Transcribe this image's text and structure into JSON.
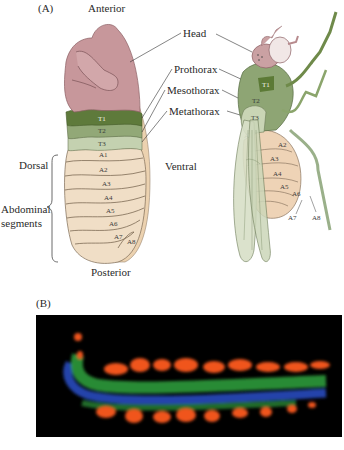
{
  "panel_a": {
    "label": "(A)",
    "anterior": "Anterior",
    "posterior": "Posterior",
    "dorsal": "Dorsal",
    "ventral": "Ventral",
    "abdominal_line1": "Abdominal",
    "abdominal_line2": "segments",
    "callouts": [
      "Head",
      "Prothorax",
      "Mesothorax",
      "Metathorax"
    ],
    "embryo_segments": {
      "thoracic": [
        "T1",
        "T2",
        "T3"
      ],
      "abdominal": [
        "A1",
        "A2",
        "A3",
        "A4",
        "A5",
        "A6",
        "A7",
        "A8"
      ]
    },
    "adult_segments": {
      "thoracic": [
        "T1",
        "T2",
        "T3"
      ],
      "abdominal": [
        "A1",
        "A2",
        "A3",
        "A4",
        "A5",
        "A6",
        "A7",
        "A8"
      ]
    },
    "colors": {
      "head": "#c9959a",
      "t1": "#5f7a3a",
      "t2": "#8ea36e",
      "t3": "#b9c8a4",
      "abdomen": "#efdcc3",
      "ventral_edge": "#e9cba6"
    }
  },
  "panel_b": {
    "label": "(B)",
    "image_description": "Fluorescent embryo stripes",
    "colors": {
      "background": "#000000",
      "orange": "#f0541c",
      "green": "#2e9a3a",
      "blue": "#2a4fc8"
    }
  }
}
